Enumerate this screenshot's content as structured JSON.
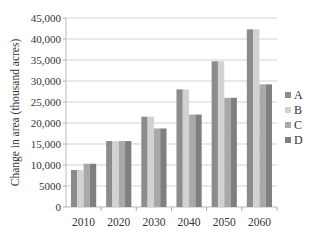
{
  "chart_data": {
    "type": "bar",
    "title": "",
    "xlabel": "",
    "ylabel": "Change in area (thousand acres)",
    "ylim": [
      0,
      45000
    ],
    "yticks": [
      0,
      5000,
      10000,
      15000,
      20000,
      25000,
      30000,
      35000,
      40000,
      45000
    ],
    "ytick_labels": [
      "0",
      "5000",
      "10,000",
      "15,000",
      "20,000",
      "25,000",
      "30,000",
      "35,000",
      "40,000",
      "45,000"
    ],
    "categories": [
      "2010",
      "2020",
      "2030",
      "2040",
      "2050",
      "2060"
    ],
    "series": [
      {
        "name": "A",
        "color": "#8c8c8c",
        "values": [
          8800,
          15700,
          21500,
          28000,
          34700,
          42300
        ]
      },
      {
        "name": "B",
        "color": "#d2d2d2",
        "values": [
          8800,
          15700,
          21500,
          28000,
          34700,
          42300
        ]
      },
      {
        "name": "C",
        "color": "#a9a9a9",
        "values": [
          10300,
          15700,
          18700,
          22000,
          26000,
          29200
        ]
      },
      {
        "name": "D",
        "color": "#7f7f7f",
        "values": [
          10300,
          15700,
          18700,
          22000,
          26000,
          29200
        ]
      }
    ],
    "grid": true,
    "legend_position": "right"
  }
}
